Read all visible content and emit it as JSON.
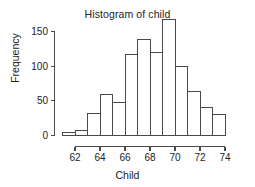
{
  "chart_data": {
    "type": "bar",
    "title": "Histogram of child",
    "xlabel": "Child",
    "ylabel": "Frequency",
    "grid": false,
    "legend": null,
    "xlim": [
      60.6,
      74.6
    ],
    "ylim": [
      0,
      175
    ],
    "xticks": [
      62,
      64,
      66,
      68,
      70,
      72,
      74
    ],
    "xtick_labels": [
      "62",
      "64",
      "66",
      "68",
      "70",
      "72",
      "74"
    ],
    "yticks": [
      0,
      50,
      100,
      150
    ],
    "ytick_labels": [
      "0",
      "50",
      "100",
      "150"
    ],
    "bin_width": 1,
    "bin_edges": [
      61,
      62,
      63,
      64,
      65,
      66,
      67,
      68,
      69,
      70,
      71,
      72,
      73,
      74
    ],
    "categories": [
      "61-62",
      "62-63",
      "63-64",
      "64-65",
      "65-66",
      "66-67",
      "67-68",
      "68-69",
      "69-70",
      "70-71",
      "71-72",
      "72-73",
      "73-74"
    ],
    "values": [
      5,
      7,
      32,
      59,
      48,
      117,
      138,
      120,
      167,
      99,
      64,
      41,
      30
    ]
  },
  "axes": {
    "y_axis_name": "frequency-axis",
    "x_axis_name": "child-axis"
  }
}
